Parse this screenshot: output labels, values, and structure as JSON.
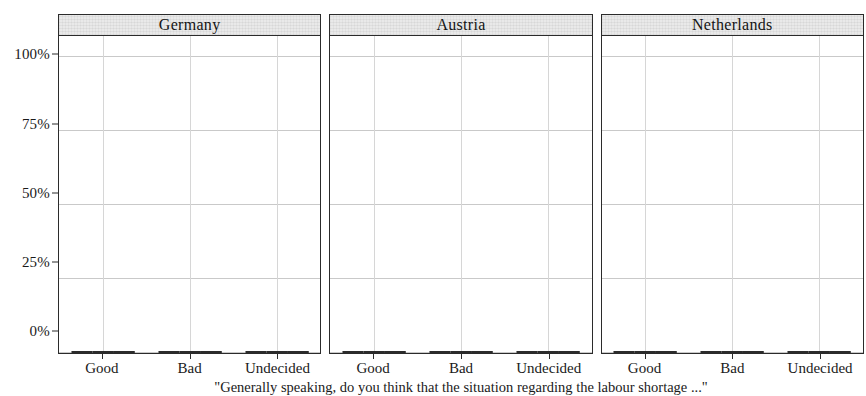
{
  "chart_data": {
    "type": "bar",
    "title": "",
    "xlabel": "",
    "ylabel": "",
    "ylim": [
      0,
      100
    ],
    "yticks": [
      0,
      25,
      50,
      75,
      100
    ],
    "ytick_labels": [
      "0%",
      "25%",
      "50%",
      "75%",
      "100%"
    ],
    "grid": true,
    "legend_position": "none",
    "categories": [
      "Good",
      "Bad",
      "Undecided"
    ],
    "panel_titles": [
      "Germany",
      "Austria",
      "Netherlands"
    ],
    "series_names": [
      "series-1-light",
      "series-2-gray",
      "series-3-black"
    ],
    "series_colors": [
      "#e2e2e2",
      "#8d8d8d",
      "#131313"
    ],
    "panels": [
      {
        "title": "Germany",
        "categories": [
          "Good",
          "Bad",
          "Undecided"
        ],
        "series": [
          {
            "name": "series-1-light",
            "values": [
              68,
              19,
              11
            ]
          },
          {
            "name": "series-2-gray",
            "values": [
              65,
              27,
              7
            ]
          },
          {
            "name": "series-3-black",
            "values": [
              72,
              21,
              6
            ]
          }
        ]
      },
      {
        "title": "Austria",
        "categories": [
          "Good",
          "Bad",
          "Undecided"
        ],
        "series": [
          {
            "name": "series-1-light",
            "values": [
              71,
              17,
              11
            ]
          },
          {
            "name": "series-2-gray",
            "values": [
              59,
              29,
              9
            ]
          },
          {
            "name": "series-3-black",
            "values": [
              64,
              25,
              9
            ]
          }
        ]
      },
      {
        "title": "Netherlands",
        "categories": [
          "Good",
          "Bad",
          "Undecided"
        ],
        "series": [
          {
            "name": "series-1-light",
            "values": [
              65,
              20,
              12
            ]
          },
          {
            "name": "series-2-gray",
            "values": [
              55,
              36,
              5
            ]
          },
          {
            "name": "series-3-black",
            "values": [
              56,
              33,
              8
            ]
          }
        ]
      }
    ]
  },
  "axis": {
    "y_tick_labels": [
      "100%",
      "75%",
      "50%",
      "25%",
      "0%"
    ]
  },
  "caption": {
    "text": "\"Generally speaking, do you think that the situation regarding the labour shortage ...\""
  }
}
